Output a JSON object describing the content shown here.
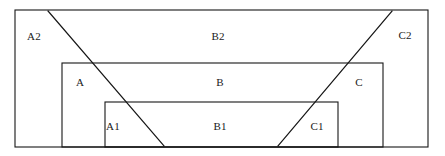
{
  "figure": {
    "width": 445,
    "height": 156,
    "background_color": "#ffffff",
    "stroke_color": "#161616",
    "text_color": "#1a1a1a"
  },
  "rectangles": [
    {
      "name": "outer-rectangle",
      "x": 15,
      "y": 10,
      "width": 413,
      "height": 137
    },
    {
      "name": "middle-rectangle",
      "x": 62,
      "y": 63,
      "width": 321,
      "height": 84
    },
    {
      "name": "inner-rectangle",
      "x": 105,
      "y": 102,
      "width": 233,
      "height": 45
    }
  ],
  "diagonals": [
    {
      "name": "left-diagonal",
      "x1": 48,
      "y1": 11,
      "x2": 164,
      "y2": 146
    },
    {
      "name": "right-diagonal",
      "x1": 392,
      "y1": 11,
      "x2": 278,
      "y2": 146
    }
  ],
  "labels": {
    "a2": "A2",
    "b2": "B2",
    "c2": "C2",
    "a": "A",
    "b": "B",
    "c": "C",
    "a1": "A1",
    "b1": "B1",
    "c1": "C1"
  },
  "label_positions": {
    "a2": {
      "x": 34,
      "y": 36
    },
    "b2": {
      "x": 218,
      "y": 36
    },
    "c2": {
      "x": 405,
      "y": 35
    },
    "a": {
      "x": 80,
      "y": 82
    },
    "b": {
      "x": 220,
      "y": 82
    },
    "c": {
      "x": 359,
      "y": 82
    },
    "a1": {
      "x": 113,
      "y": 126
    },
    "b1": {
      "x": 220,
      "y": 126
    },
    "c1": {
      "x": 317,
      "y": 126
    }
  }
}
